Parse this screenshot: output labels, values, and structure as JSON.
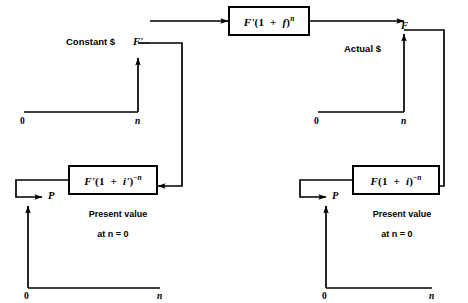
{
  "diagram": {
    "line_color": "#000000",
    "background": "#ffffff"
  },
  "boxes": {
    "future_actual": {
      "id": "future-worth-actual",
      "formula_plain": "F'(1 + f)^n",
      "base": "F",
      "prime": "'",
      "open": "(1",
      "plus": "+",
      "rate": "f",
      "close": ")",
      "exponent": "n"
    },
    "pv_constant": {
      "id": "present-value-constant",
      "formula_plain": "F'(1 + i')^-n",
      "base": "F",
      "prime": "'",
      "open": "(1",
      "plus": "+",
      "rate": "i'",
      "close": ")",
      "exponent_sign": "−",
      "exponent": "n",
      "caption_line1": "Present value",
      "caption_line2": "at n = 0"
    },
    "pv_actual": {
      "id": "present-value-actual",
      "formula_plain": "F(1 + i)^-n",
      "base": "F",
      "prime": "",
      "open": "(1",
      "plus": "+",
      "rate": "i",
      "close": ")",
      "exponent_sign": "−",
      "exponent": "n",
      "caption_line1": "Present value",
      "caption_line2": "at n = 0"
    }
  },
  "charts": {
    "constant_future": {
      "name": "constant-dollar-future-cashflow",
      "title": "Constant $",
      "arrow_label": "F'",
      "origin_label": "0",
      "end_label": "n",
      "arrow_position": "n",
      "arrow_direction": "up"
    },
    "actual_future": {
      "name": "actual-dollar-future-cashflow",
      "title": "Actual $",
      "arrow_label": "F",
      "origin_label": "0",
      "end_label": "n",
      "arrow_position": "n",
      "arrow_direction": "up"
    },
    "constant_present": {
      "name": "constant-dollar-present-cashflow",
      "arrow_label": "P",
      "origin_label": "0",
      "end_label": "n",
      "arrow_position": "0",
      "arrow_direction": "up"
    },
    "actual_present": {
      "name": "actual-dollar-present-cashflow",
      "arrow_label": "P",
      "origin_label": "0",
      "end_label": "n",
      "arrow_position": "0",
      "arrow_direction": "up"
    }
  }
}
